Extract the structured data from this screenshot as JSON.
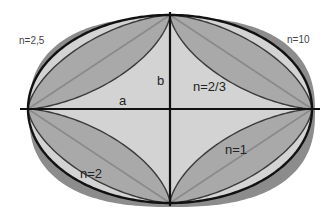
{
  "diagram": {
    "center": [
      170,
      109
    ],
    "semi_axis_a": 142,
    "semi_axis_b": 94,
    "colors": {
      "background": "#ffffff",
      "outer_shadow": "#8c8c8c",
      "ellipse_fill": "#d3d3d3",
      "lens_fill": "#a9a9a9",
      "stroke": "#111111",
      "diag_stroke": "#8a8a8a",
      "curve_stroke": "#3a3a3a"
    },
    "curves": [
      {
        "n": "2,5",
        "role": "outer superellipse (shadow)"
      },
      {
        "n": "2",
        "role": "ellipse outline"
      },
      {
        "n": "1",
        "role": "diamond diagonals"
      },
      {
        "n": "2/3",
        "role": "astroid curves"
      },
      {
        "n": "10",
        "role": "near-rectangle"
      }
    ],
    "labels": {
      "n25": "n=2,5",
      "n10": "n=10",
      "b": "b",
      "a": "a",
      "n23": "n=2/3",
      "n2": "n=2",
      "n1": "n=1"
    }
  }
}
